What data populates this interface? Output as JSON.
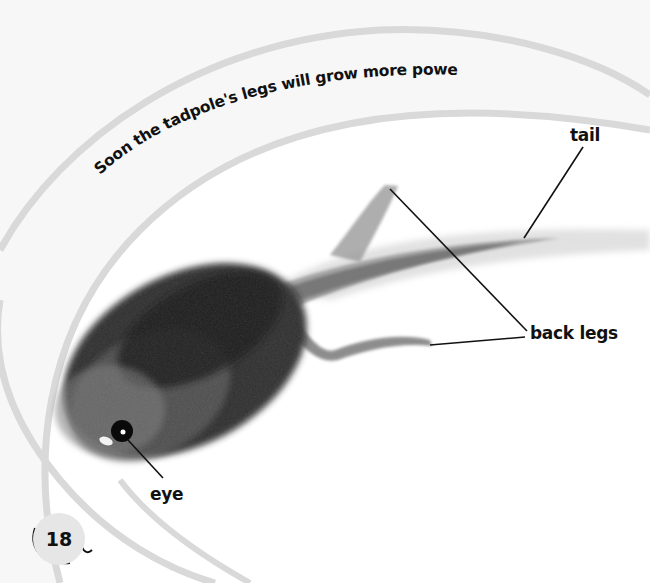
{
  "page": {
    "caption": "Soon the tadpole's legs will grow more powerful.",
    "page_number": "18"
  },
  "labels": {
    "tail": "tail",
    "back_legs": "back legs",
    "eye": "eye"
  },
  "image": {
    "subject": "tadpole with back legs (photograph)"
  },
  "colors": {
    "background": "#f7f7f7",
    "inner_panel": "#ffffff",
    "arc_stroke": "#d9d9d9",
    "text": "#111111"
  }
}
